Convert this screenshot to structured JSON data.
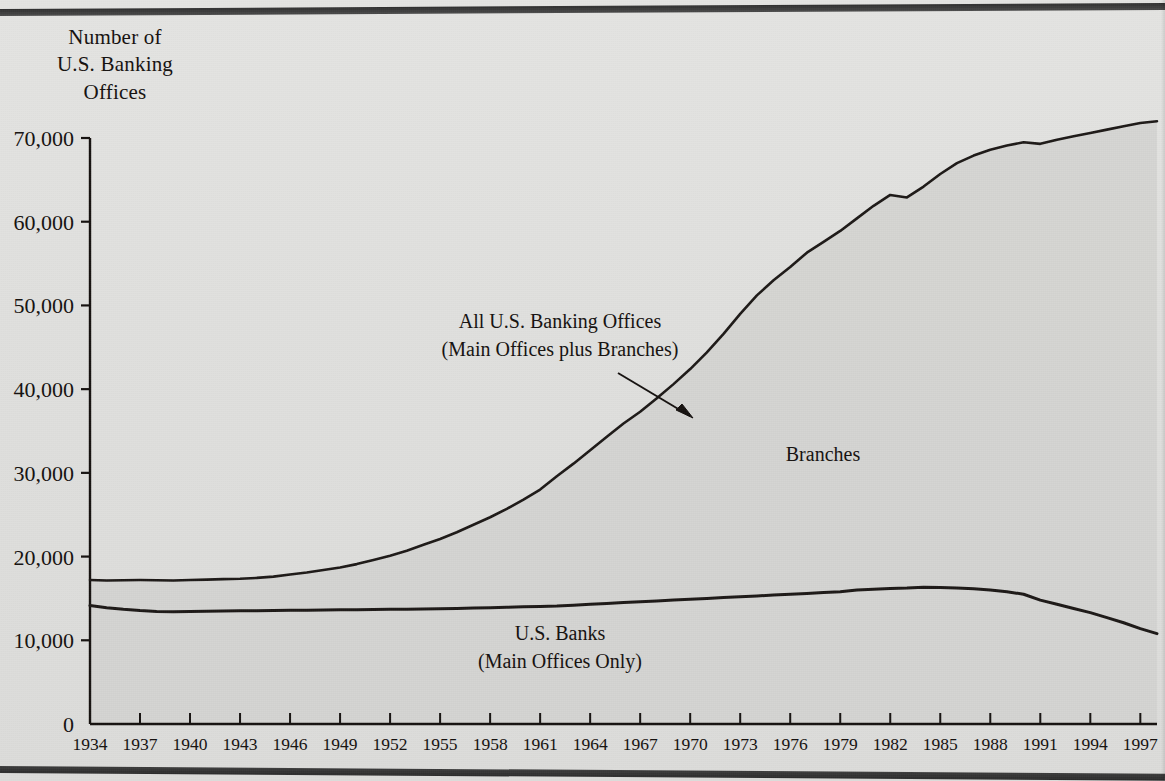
{
  "axis": {
    "y_title_lines": [
      "Number of",
      "U.S. Banking",
      "Offices"
    ],
    "y_ticks": [
      "0",
      "10,000",
      "20,000",
      "30,000",
      "40,000",
      "50,000",
      "60,000",
      "70,000"
    ],
    "x_ticks": [
      "1934",
      "1937",
      "1940",
      "1943",
      "1946",
      "1949",
      "1952",
      "1955",
      "1958",
      "1961",
      "1964",
      "1967",
      "1970",
      "1973",
      "1976",
      "1979",
      "1982",
      "1985",
      "1988",
      "1991",
      "1994",
      "1997"
    ]
  },
  "annotations": {
    "total_line1": "All U.S. Banking Offices",
    "total_line2": "(Main Offices plus Branches)",
    "branches": "Branches",
    "banks_line1": "U.S. Banks",
    "banks_line2": "(Main Offices Only)"
  },
  "colors": {
    "ink": "#14100e",
    "page": "#e2e2e0",
    "fill_branches": "#d2d2d0",
    "line": "#1c1816"
  },
  "chart_data": {
    "type": "area",
    "title": "Number of U.S. Banking Offices",
    "xlabel": "",
    "ylabel": "Number of U.S. Banking Offices",
    "xlim": [
      1934,
      1998
    ],
    "ylim": [
      0,
      70000
    ],
    "grid": false,
    "legend": "inline annotations",
    "x": [
      1934,
      1935,
      1936,
      1937,
      1938,
      1939,
      1940,
      1941,
      1942,
      1943,
      1944,
      1945,
      1946,
      1947,
      1948,
      1949,
      1950,
      1951,
      1952,
      1953,
      1954,
      1955,
      1956,
      1957,
      1958,
      1959,
      1960,
      1961,
      1962,
      1963,
      1964,
      1965,
      1966,
      1967,
      1968,
      1969,
      1970,
      1971,
      1972,
      1973,
      1974,
      1975,
      1976,
      1977,
      1978,
      1979,
      1980,
      1981,
      1982,
      1983,
      1984,
      1985,
      1986,
      1987,
      1988,
      1989,
      1990,
      1991,
      1992,
      1993,
      1994,
      1995,
      1996,
      1997,
      1998
    ],
    "series": [
      {
        "name": "All U.S. Banking Offices (Main Offices plus Branches)",
        "values": [
          17200,
          17150,
          17180,
          17200,
          17180,
          17150,
          17200,
          17250,
          17300,
          17350,
          17450,
          17600,
          17850,
          18100,
          18400,
          18700,
          19100,
          19600,
          20100,
          20700,
          21400,
          22100,
          22900,
          23800,
          24700,
          25700,
          26800,
          28000,
          29600,
          31100,
          32700,
          34300,
          35900,
          37300,
          38900,
          40600,
          42400,
          44400,
          46600,
          49000,
          51200,
          53000,
          54600,
          56300,
          57600,
          58900,
          60400,
          61900,
          63200,
          62900,
          64200,
          65700,
          67000,
          67900,
          68600,
          69100,
          69500,
          69300,
          69800,
          70200,
          70600,
          71000,
          71400,
          71800,
          72000
        ]
      },
      {
        "name": "U.S. Banks (Main Offices Only)",
        "values": [
          14150,
          13900,
          13700,
          13550,
          13450,
          13400,
          13450,
          13480,
          13500,
          13520,
          13540,
          13560,
          13580,
          13600,
          13620,
          13640,
          13660,
          13680,
          13700,
          13720,
          13750,
          13780,
          13810,
          13850,
          13900,
          13950,
          14000,
          14050,
          14100,
          14200,
          14300,
          14400,
          14500,
          14600,
          14700,
          14800,
          14900,
          15000,
          15100,
          15200,
          15300,
          15400,
          15500,
          15600,
          15700,
          15800,
          16000,
          16100,
          16200,
          16250,
          16350,
          16300,
          16250,
          16150,
          16000,
          15800,
          15500,
          14800,
          14300,
          13800,
          13300,
          12700,
          12100,
          11400,
          10800
        ]
      }
    ],
    "note": "Shaded area between the two curves represents Branches"
  }
}
